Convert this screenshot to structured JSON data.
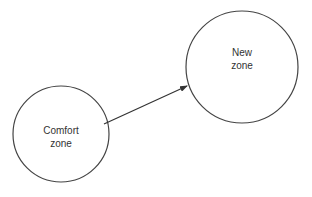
{
  "diagram": {
    "type": "flow",
    "nodes": [
      {
        "id": "comfort",
        "label": "Comfort\nzone",
        "shape": "circle",
        "cx": 61,
        "cy": 134,
        "r": 48
      },
      {
        "id": "new",
        "label": "New\nzone",
        "shape": "circle",
        "cx": 242,
        "cy": 67,
        "r": 56
      }
    ],
    "edges": [
      {
        "from": "comfort",
        "to": "new",
        "directed": true,
        "x1": 104,
        "y1": 124,
        "x2": 187,
        "y2": 86
      }
    ],
    "colors": {
      "stroke": "#444444",
      "text": "#333333",
      "background": "#ffffff"
    }
  }
}
